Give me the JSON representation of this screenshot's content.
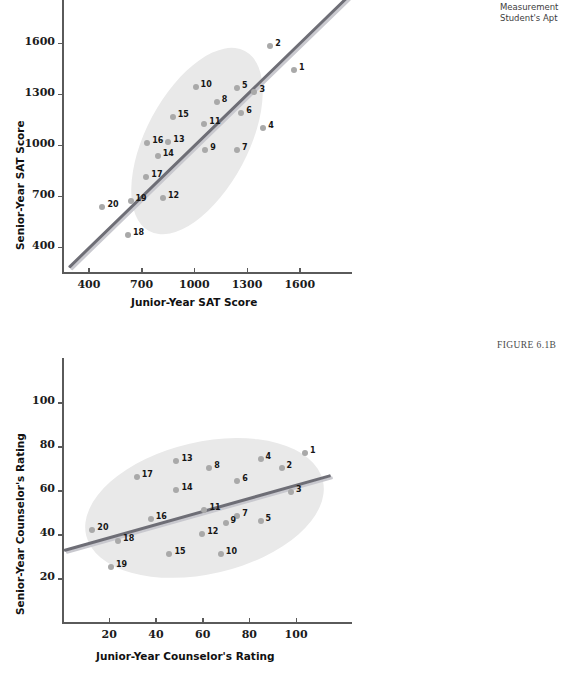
{
  "figures": {
    "a": {
      "caption_line1": "Measurement",
      "caption_line2": "Student's Apt"
    },
    "b": {
      "figure_label": "FIGURE 6.1B"
    }
  },
  "chart_data": [
    {
      "id": "chart-a",
      "type": "scatter",
      "title": "",
      "xlabel": "Junior-Year SAT Score",
      "ylabel": "Senior-Year SAT Score",
      "xticks": [
        400,
        700,
        1000,
        1300,
        1600
      ],
      "yticks": [
        400,
        700,
        1000,
        1300,
        1600
      ],
      "xlim": [
        250,
        1900
      ],
      "ylim": [
        250,
        1850
      ],
      "grid": false,
      "legend": "none",
      "annotations": [
        "regression line",
        "confidence ellipse"
      ],
      "points": [
        {
          "label": "1",
          "x": 1570,
          "y": 1440
        },
        {
          "label": "2",
          "x": 1435,
          "y": 1580
        },
        {
          "label": "3",
          "x": 1345,
          "y": 1310
        },
        {
          "label": "4",
          "x": 1395,
          "y": 1095
        },
        {
          "label": "5",
          "x": 1245,
          "y": 1330
        },
        {
          "label": "6",
          "x": 1270,
          "y": 1185
        },
        {
          "label": "7",
          "x": 1245,
          "y": 965
        },
        {
          "label": "8",
          "x": 1130,
          "y": 1250
        },
        {
          "label": "9",
          "x": 1065,
          "y": 965
        },
        {
          "label": "10",
          "x": 1010,
          "y": 1340
        },
        {
          "label": "11",
          "x": 1060,
          "y": 1120
        },
        {
          "label": "12",
          "x": 825,
          "y": 685
        },
        {
          "label": "13",
          "x": 855,
          "y": 1015
        },
        {
          "label": "14",
          "x": 795,
          "y": 935
        },
        {
          "label": "15",
          "x": 880,
          "y": 1160
        },
        {
          "label": "16",
          "x": 735,
          "y": 1010
        },
        {
          "label": "17",
          "x": 730,
          "y": 810
        },
        {
          "label": "18",
          "x": 625,
          "y": 465
        },
        {
          "label": "19",
          "x": 640,
          "y": 665
        },
        {
          "label": "20",
          "x": 480,
          "y": 630
        }
      ]
    },
    {
      "id": "chart-b",
      "type": "scatter",
      "title": "",
      "xlabel": "Junior-Year Counselor's Rating",
      "ylabel": "Senior-Year Counselor's Rating",
      "xticks": [
        20,
        40,
        60,
        80,
        100
      ],
      "yticks": [
        20,
        40,
        60,
        80,
        100
      ],
      "xlim": [
        0,
        125
      ],
      "ylim": [
        0,
        120
      ],
      "grid": false,
      "legend": "none",
      "annotations": [
        "regression line",
        "confidence ellipse"
      ],
      "points": [
        {
          "label": "1",
          "x": 104,
          "y": 77
        },
        {
          "label": "2",
          "x": 94,
          "y": 70
        },
        {
          "label": "3",
          "x": 98,
          "y": 59
        },
        {
          "label": "4",
          "x": 85,
          "y": 74
        },
        {
          "label": "5",
          "x": 85,
          "y": 46
        },
        {
          "label": "6",
          "x": 75,
          "y": 64
        },
        {
          "label": "7",
          "x": 75,
          "y": 48
        },
        {
          "label": "8",
          "x": 63,
          "y": 70
        },
        {
          "label": "9",
          "x": 70,
          "y": 45
        },
        {
          "label": "10",
          "x": 68,
          "y": 31
        },
        {
          "label": "11",
          "x": 61,
          "y": 51
        },
        {
          "label": "12",
          "x": 60,
          "y": 40
        },
        {
          "label": "13",
          "x": 49,
          "y": 73
        },
        {
          "label": "14",
          "x": 49,
          "y": 60
        },
        {
          "label": "15",
          "x": 46,
          "y": 31
        },
        {
          "label": "16",
          "x": 38,
          "y": 47
        },
        {
          "label": "17",
          "x": 32,
          "y": 66
        },
        {
          "label": "18",
          "x": 24,
          "y": 37
        },
        {
          "label": "19",
          "x": 21,
          "y": 25
        },
        {
          "label": "20",
          "x": 13,
          "y": 42
        }
      ]
    }
  ]
}
